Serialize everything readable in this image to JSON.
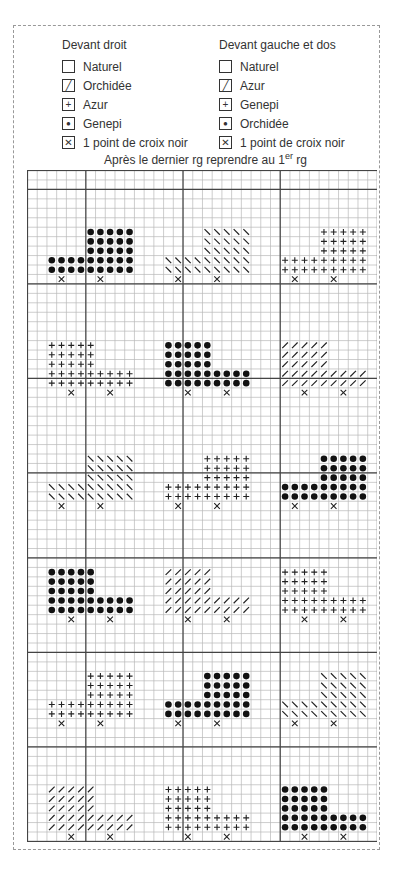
{
  "legend": {
    "left": {
      "title": "Devant droit",
      "items": [
        {
          "symbol": "empty",
          "label": "Naturel"
        },
        {
          "symbol": "slash",
          "label": "Orchidée"
        },
        {
          "symbol": "plus",
          "label": "Azur"
        },
        {
          "symbol": "dot",
          "label": "Genepi"
        },
        {
          "symbol": "cross",
          "label": "1 point de croix noir"
        }
      ]
    },
    "right": {
      "title": "Devant gauche et dos",
      "items": [
        {
          "symbol": "empty",
          "label": "Naturel"
        },
        {
          "symbol": "slash",
          "label": "Azur"
        },
        {
          "symbol": "plus",
          "label": "Genepi"
        },
        {
          "symbol": "dot",
          "label": "Orchidée"
        },
        {
          "symbol": "cross",
          "label": "1 point de croix noir"
        }
      ]
    }
  },
  "note": {
    "text": "Après le dernier rg reprendre au 1",
    "sup": "er",
    "tail": " rg"
  },
  "grid": {
    "cols": 36,
    "rows": 71,
    "heavy_cols": [
      6,
      16,
      26
    ],
    "heavy_rows": [
      2,
      12,
      22,
      32,
      41,
      51,
      61
    ],
    "motif": {
      "width": 9,
      "block_width": 5,
      "block_rows": 3,
      "base_rows": 2,
      "cross_offsets": [
        1,
        5
      ]
    },
    "motifs": [
      {
        "row": 6,
        "col": 2,
        "symbol": "dot",
        "block": "right"
      },
      {
        "row": 6,
        "col": 14,
        "symbol": "backslash",
        "block": "right"
      },
      {
        "row": 6,
        "col": 26,
        "symbol": "plus",
        "block": "right"
      },
      {
        "row": 18,
        "col": 2,
        "symbol": "plus",
        "block": "left"
      },
      {
        "row": 18,
        "col": 14,
        "symbol": "dot",
        "block": "left"
      },
      {
        "row": 18,
        "col": 26,
        "symbol": "slash",
        "block": "left"
      },
      {
        "row": 30,
        "col": 2,
        "symbol": "backslash",
        "block": "right"
      },
      {
        "row": 30,
        "col": 14,
        "symbol": "plus",
        "block": "right"
      },
      {
        "row": 30,
        "col": 26,
        "symbol": "dot",
        "block": "right"
      },
      {
        "row": 42,
        "col": 2,
        "symbol": "dot",
        "block": "left"
      },
      {
        "row": 42,
        "col": 14,
        "symbol": "slash",
        "block": "left"
      },
      {
        "row": 42,
        "col": 26,
        "symbol": "plus",
        "block": "left"
      },
      {
        "row": 53,
        "col": 2,
        "symbol": "plus",
        "block": "right"
      },
      {
        "row": 53,
        "col": 14,
        "symbol": "dot",
        "block": "right"
      },
      {
        "row": 53,
        "col": 26,
        "symbol": "backslash",
        "block": "right"
      },
      {
        "row": 65,
        "col": 2,
        "symbol": "slash",
        "block": "left"
      },
      {
        "row": 65,
        "col": 14,
        "symbol": "plus",
        "block": "left"
      },
      {
        "row": 65,
        "col": 26,
        "symbol": "dot",
        "block": "left"
      }
    ]
  }
}
